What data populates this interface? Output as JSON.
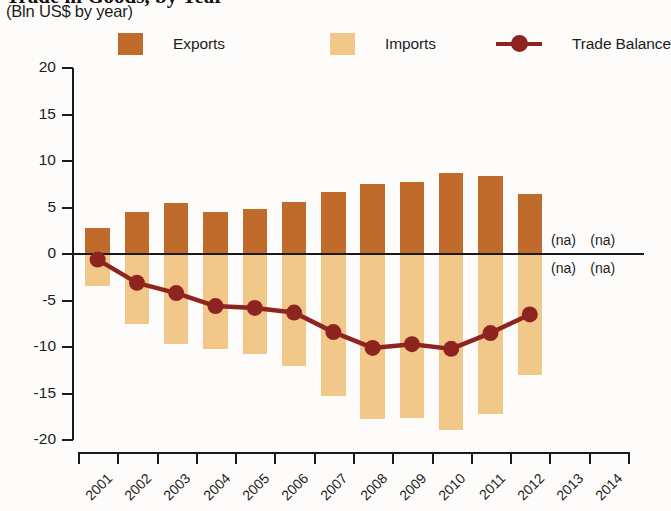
{
  "header": {
    "title": "Trade in Goods, by Year",
    "subtitle": "(Bln US$ by year)"
  },
  "legend": {
    "position": "top",
    "items": [
      {
        "label": "Exports",
        "marker": "square-swatch",
        "color": "#C06A2C"
      },
      {
        "label": "Imports",
        "marker": "square-swatch",
        "color": "#F2C88A"
      },
      {
        "label": "Trade Balance",
        "marker": "line-with-circle",
        "color": "#8E2420"
      }
    ]
  },
  "annotations": {
    "na_text": "(na)",
    "items": [
      {
        "text": "(na)",
        "x": 2013,
        "side": "above-zero"
      },
      {
        "text": "(na)",
        "x": 2014,
        "side": "above-zero"
      },
      {
        "text": "(na)",
        "x": 2013,
        "side": "below-zero"
      },
      {
        "text": "(na)",
        "x": 2014,
        "side": "below-zero"
      }
    ]
  },
  "chart_data": {
    "type": "bar",
    "title": "Trade in Goods, by Year",
    "subtitle": "(Bln US$ by year)",
    "xlabel": "",
    "ylabel": "(Bln US$ by year)",
    "ylim": [
      -20,
      20
    ],
    "yticks": [
      20,
      15,
      10,
      5,
      0,
      -5,
      -10,
      -15,
      -20
    ],
    "ytick_labels": [
      "20",
      "15",
      "10",
      "5",
      "0",
      "-5",
      "-10",
      "-15",
      "-20"
    ],
    "grid": false,
    "categories": [
      2001,
      2002,
      2003,
      2004,
      2005,
      2006,
      2007,
      2008,
      2009,
      2010,
      2011,
      2012,
      2013,
      2014
    ],
    "xtick_labels": [
      "2001",
      "2002",
      "2003",
      "2004",
      "2005",
      "2006",
      "2007",
      "2008",
      "2009",
      "2010",
      "2011",
      "2012",
      "2013",
      "2014"
    ],
    "series": [
      {
        "name": "Exports",
        "type": "bar",
        "color": "#C06A2C",
        "values": [
          2.8,
          4.5,
          5.5,
          4.5,
          4.8,
          5.6,
          6.7,
          7.5,
          7.7,
          8.7,
          8.4,
          6.4,
          null,
          null
        ]
      },
      {
        "name": "Imports",
        "type": "bar",
        "color": "#F2C88A",
        "values": [
          -3.4,
          -7.5,
          -9.7,
          -10.2,
          -10.8,
          -12.0,
          -15.3,
          -17.7,
          -17.6,
          -18.9,
          -17.2,
          -13.0,
          null,
          null
        ]
      },
      {
        "name": "Trade Balance",
        "type": "line",
        "color": "#8E2420",
        "values": [
          -0.6,
          -3.1,
          -4.2,
          -5.6,
          -5.8,
          -6.3,
          -8.4,
          -10.1,
          -9.7,
          -10.2,
          -8.5,
          -6.5,
          null,
          null
        ]
      }
    ]
  }
}
